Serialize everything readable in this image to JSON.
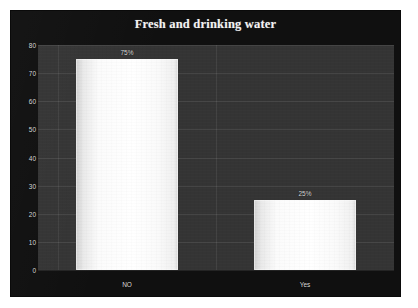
{
  "chart_data": {
    "type": "bar",
    "title": "Fresh and drinking water",
    "xlabel": "",
    "ylabel": "",
    "categories": [
      "NO",
      "Yes"
    ],
    "values": [
      75,
      25
    ],
    "data_labels": [
      "75%",
      "25%"
    ],
    "ylim": [
      0,
      80
    ],
    "y_ticks": [
      0,
      10,
      20,
      30,
      40,
      50,
      60,
      70,
      80
    ],
    "y_tick_labels": [
      "0",
      "10",
      "20",
      "30",
      "40",
      "50",
      "60",
      "70",
      "80"
    ],
    "grid": true,
    "legend": false,
    "legend_position": "none",
    "colors": {
      "page_background": "#ffffff",
      "frame_background": "#101010",
      "plot_background": "#343434",
      "bar_fill": "#ffffff",
      "bar_edge": "#d0d0d0",
      "gridline": "#4a4a4a",
      "title_text": "#f2f2f2",
      "tick_text": "#d8d8d8",
      "data_label_text": "#d9d9d9"
    }
  }
}
